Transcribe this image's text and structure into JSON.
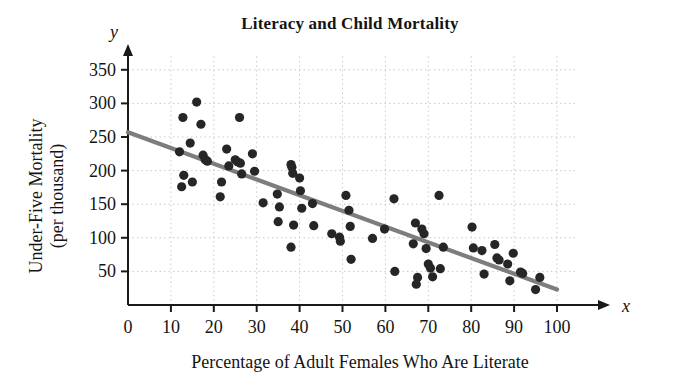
{
  "chart_data": {
    "type": "scatter",
    "title": "Literacy and Child Mortality",
    "xlabel": "Percentage of Adult Females Who Are Literate",
    "ylabel": "Under-Five Mortality (per thousand)",
    "ylabel_line1": "Under-Five Mortality",
    "ylabel_line2": "(per thousand)",
    "x_axis_variable": "x",
    "y_axis_variable": "y",
    "xlim": [
      0,
      104
    ],
    "ylim": [
      0,
      370
    ],
    "xticks": [
      0,
      10,
      20,
      30,
      40,
      50,
      60,
      70,
      80,
      90,
      100
    ],
    "yticks": [
      50,
      100,
      150,
      200,
      250,
      300,
      350
    ],
    "grid": true,
    "grid_style": "dotted",
    "point_color": "#262626",
    "line_color": "#7d7d7d",
    "axis_color": "#1a1a1a",
    "trendline": {
      "type": "linear-fit",
      "x_start": 0,
      "y_start": 257,
      "x_end": 100,
      "y_end": 23,
      "slope": -2.34,
      "intercept": 257
    },
    "points": [
      [
        12.0,
        228
      ],
      [
        12.5,
        176
      ],
      [
        13.0,
        193
      ],
      [
        14.5,
        241
      ],
      [
        15.0,
        183
      ],
      [
        16.0,
        302
      ],
      [
        12.8,
        279
      ],
      [
        17.0,
        269
      ],
      [
        17.5,
        223
      ],
      [
        18.0,
        216
      ],
      [
        18.5,
        214
      ],
      [
        21.5,
        161
      ],
      [
        21.8,
        183
      ],
      [
        23.0,
        232
      ],
      [
        23.5,
        207
      ],
      [
        25.0,
        216
      ],
      [
        25.5,
        213
      ],
      [
        26.0,
        279
      ],
      [
        26.2,
        211
      ],
      [
        26.5,
        195
      ],
      [
        29.0,
        225
      ],
      [
        29.5,
        199
      ],
      [
        31.5,
        152
      ],
      [
        34.8,
        165
      ],
      [
        35.0,
        124
      ],
      [
        35.3,
        146
      ],
      [
        38.0,
        209
      ],
      [
        38.2,
        205
      ],
      [
        38.4,
        196
      ],
      [
        38.0,
        86
      ],
      [
        38.6,
        119
      ],
      [
        40.0,
        189
      ],
      [
        40.2,
        170
      ],
      [
        40.5,
        144
      ],
      [
        43.0,
        151
      ],
      [
        43.3,
        118
      ],
      [
        47.5,
        106
      ],
      [
        49.3,
        101
      ],
      [
        49.5,
        95
      ],
      [
        50.8,
        163
      ],
      [
        51.5,
        141
      ],
      [
        51.8,
        117
      ],
      [
        52.0,
        68
      ],
      [
        57.0,
        99
      ],
      [
        59.8,
        113
      ],
      [
        62.0,
        158
      ],
      [
        62.2,
        50
      ],
      [
        66.5,
        91
      ],
      [
        67.0,
        122
      ],
      [
        67.2,
        31
      ],
      [
        67.5,
        41
      ],
      [
        68.5,
        113
      ],
      [
        69.0,
        106
      ],
      [
        69.5,
        84
      ],
      [
        70.0,
        61
      ],
      [
        70.5,
        55
      ],
      [
        71.0,
        42
      ],
      [
        72.5,
        163
      ],
      [
        72.8,
        54
      ],
      [
        73.5,
        86
      ],
      [
        80.2,
        116
      ],
      [
        80.5,
        85
      ],
      [
        82.5,
        81
      ],
      [
        83.0,
        46
      ],
      [
        85.5,
        90
      ],
      [
        86.0,
        70
      ],
      [
        86.5,
        67
      ],
      [
        88.5,
        61
      ],
      [
        89.0,
        36
      ],
      [
        89.8,
        77
      ],
      [
        91.5,
        49
      ],
      [
        92.0,
        47
      ],
      [
        95.0,
        23
      ],
      [
        96.0,
        41
      ]
    ]
  }
}
